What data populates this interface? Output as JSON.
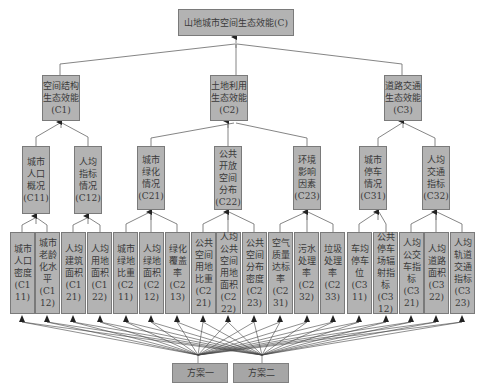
{
  "diagram": {
    "goal": {
      "label": "山地城市空间生态效能(C)"
    },
    "criteria": [
      {
        "label": "空间结构生态效能",
        "code": "(C1)"
      },
      {
        "label": "土地利用生态效能",
        "code": "(C2)"
      },
      {
        "label": "道路交通生态效能",
        "code": "(C3)"
      }
    ],
    "subcriteria": [
      {
        "label": "城市人口概况",
        "code": "(C11)"
      },
      {
        "label": "人均指标情况",
        "code": "(C12)"
      },
      {
        "label": "城市绿化情况",
        "code": "(C21)"
      },
      {
        "label": "公共开放空间分布",
        "code": "(C22)"
      },
      {
        "label": "环境影响因素",
        "code": "(C23)"
      },
      {
        "label": "城市停车情况",
        "code": "(C31)"
      },
      {
        "label": "人均交通指标",
        "code": "(C32)"
      }
    ],
    "indicators": [
      {
        "label": "城市人口密度",
        "code": "(C111)"
      },
      {
        "label": "城市老龄化水平",
        "code": "(C112)"
      },
      {
        "label": "人均建筑面积",
        "code": "(C121)"
      },
      {
        "label": "人均用地面积",
        "code": "(C122)"
      },
      {
        "label": "城市绿地比重",
        "code": "(C211)"
      },
      {
        "label": "人均绿地面积",
        "code": "(C212)"
      },
      {
        "label": "绿化覆盖率",
        "code": "(C213)"
      },
      {
        "label": "公共空间用地比重",
        "code": "(C221)"
      },
      {
        "label": "人均公共空间用地面积",
        "code": "(C222)"
      },
      {
        "label": "公共空间分布密度",
        "code": "(C223)"
      },
      {
        "label": "空气质量达标率",
        "code": "(C231)"
      },
      {
        "label": "污水处理率",
        "code": "(C232)"
      },
      {
        "label": "垃圾处理率",
        "code": "(C233)"
      },
      {
        "label": "车均停车位",
        "code": "(C311)"
      },
      {
        "label": "公共停车场辐射指标",
        "code": "(C312)"
      },
      {
        "label": "人均公交车指标",
        "code": "(C321)"
      },
      {
        "label": "人均道路面积",
        "code": "(C322)"
      },
      {
        "label": "人均轨道交通指标",
        "code": "(C323)"
      }
    ],
    "plans": [
      {
        "label": "方案一"
      },
      {
        "label": "方案二"
      }
    ],
    "colors": {
      "box_fill": "#b3b3b3",
      "box_border": "#7a7a7a",
      "line": "#555555"
    }
  }
}
